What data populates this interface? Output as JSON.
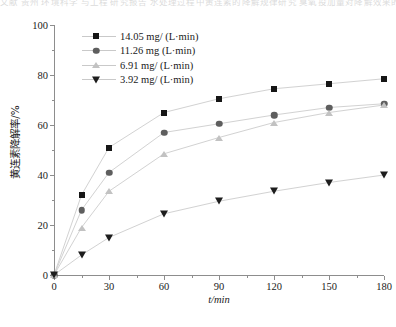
{
  "page_fragment_text": "文献 贵州 环境科学 与工程 研究报告   水处理过程中黄连素的降解规律研究   臭氧投加量对降解效果的影响",
  "chart_data": {
    "type": "line",
    "title": "",
    "xlabel": "t/min",
    "ylabel": "黄连素降解率/%",
    "xlim": [
      0,
      180
    ],
    "ylim": [
      0,
      100
    ],
    "xticks": [
      0,
      30,
      60,
      90,
      120,
      150,
      180
    ],
    "xticks_minor": [
      15,
      45,
      75,
      105,
      135,
      165
    ],
    "yticks": [
      0,
      20,
      40,
      60,
      80,
      100
    ],
    "yticks_minor": [
      10,
      30,
      50,
      70,
      90
    ],
    "grid": false,
    "legend_position": "upper-left-inside",
    "x": [
      0,
      15,
      30,
      60,
      90,
      120,
      150,
      180
    ],
    "series": [
      {
        "name": "14.05 mg/ (L·min)",
        "marker": "square",
        "color": "#161616",
        "values": [
          0,
          32,
          51,
          65,
          70.5,
          74.5,
          76.5,
          78.5
        ]
      },
      {
        "name": "11.26 mg (L·min)",
        "marker": "circle",
        "color": "#5e5e5e",
        "values": [
          0,
          26,
          41,
          57,
          60.5,
          64,
          67,
          68.5
        ]
      },
      {
        "name": "6.91 mg/ (L·min)",
        "marker": "triangle-up",
        "color": "#c2c2c2",
        "values": [
          0,
          19,
          33.5,
          48.5,
          55,
          61,
          65,
          68
        ]
      },
      {
        "name": "3.92 mg/ (L·min)",
        "marker": "triangle-down",
        "color": "#1d1d1d",
        "values": [
          0,
          8,
          15,
          24.5,
          29.5,
          33.5,
          37,
          40
        ]
      }
    ]
  }
}
